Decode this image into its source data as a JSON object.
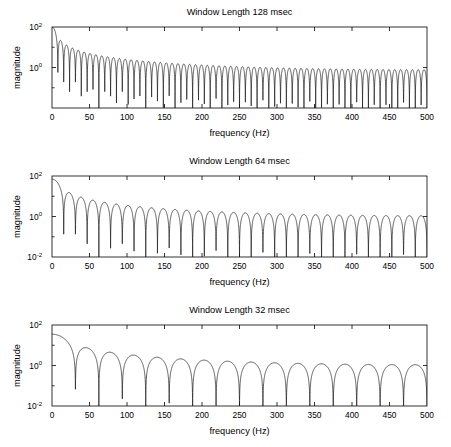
{
  "figure": {
    "background": "#ffffff",
    "line_color": "#1a1a1a",
    "axis_color": "#000000"
  },
  "panels": [
    {
      "title": "Window Length 128 msec",
      "xlabel": "frequency (Hz)",
      "ylabel": "magnitude",
      "xticks": [
        0,
        50,
        100,
        150,
        200,
        250,
        300,
        350,
        400,
        450,
        500
      ],
      "xticklabels": [
        "0",
        "50",
        "100",
        "150",
        "200",
        "250",
        "300",
        "350",
        "400",
        "450",
        "500"
      ],
      "yticks": [
        100,
        1
      ],
      "yticklabels": [
        "10",
        "10"
      ],
      "yexponents": [
        "2",
        "0"
      ],
      "ylim": [
        0.01,
        100
      ],
      "xlim": [
        0,
        500
      ]
    },
    {
      "title": "Window Length 64 msec",
      "xlabel": "frequency (Hz)",
      "ylabel": "magnitude",
      "xticks": [
        0,
        50,
        100,
        150,
        200,
        250,
        300,
        350,
        400,
        450,
        500
      ],
      "xticklabels": [
        "0",
        "50",
        "100",
        "150",
        "200",
        "250",
        "300",
        "350",
        "400",
        "450",
        "500"
      ],
      "yticks": [
        100,
        1,
        0.01
      ],
      "yticklabels": [
        "10",
        "10",
        "10"
      ],
      "yexponents": [
        "2",
        "0",
        "-2"
      ],
      "ylim": [
        0.01,
        100
      ],
      "xlim": [
        0,
        500
      ]
    },
    {
      "title": "Window Length 32 msec",
      "xlabel": "frequency (Hz)",
      "ylabel": "magnitude",
      "xticks": [
        0,
        50,
        100,
        150,
        200,
        250,
        300,
        350,
        400,
        450,
        500
      ],
      "xticklabels": [
        "0",
        "50",
        "100",
        "150",
        "200",
        "250",
        "300",
        "350",
        "400",
        "450",
        "500"
      ],
      "yticks": [
        100,
        1,
        0.01
      ],
      "yticklabels": [
        "10",
        "10",
        "10"
      ],
      "yexponents": [
        "2",
        "0",
        "-2"
      ],
      "ylim": [
        0.01,
        100
      ],
      "xlim": [
        0,
        500
      ]
    }
  ],
  "chart_data": [
    {
      "type": "line",
      "title": "Window Length 128 msec",
      "xlabel": "frequency (Hz)",
      "ylabel": "magnitude",
      "xlim": [
        0,
        500
      ],
      "ylim": [
        0.01,
        100
      ],
      "yscale": "log",
      "grid": false,
      "legend": null,
      "series": [
        {
          "name": "magnitude spectrum, 128 msec window",
          "description": "Sinc-like magnitude response of a 128 msec rectangular window; main lobe peaks near 100 at 0 Hz, rapid sidelobe ripple whose envelope decays to a minimum of about 1 near 250 Hz then grows again toward 500 Hz",
          "model": "window_sinc",
          "window_msec": 128,
          "peak_value": 100,
          "null_spacing_hz": 7.8,
          "envelope_minimum_hz": 250,
          "envelope_minimum_value": 0.9,
          "value_at_500hz": 1.0
        }
      ]
    },
    {
      "type": "line",
      "title": "Window Length 64 msec",
      "xlabel": "frequency (Hz)",
      "ylabel": "magnitude",
      "xlim": [
        0,
        500
      ],
      "ylim": [
        0.01,
        100
      ],
      "yscale": "log",
      "grid": false,
      "legend": null,
      "series": [
        {
          "name": "magnitude spectrum, 64 msec window",
          "description": "Sinc-like magnitude response of a 64 msec window; peak near 70 at low frequency, lobes spaced about 15.6 Hz, deep null reaching below 10^-2 at 250 Hz",
          "model": "window_sinc",
          "window_msec": 64,
          "peak_value": 70,
          "null_spacing_hz": 15.6,
          "deep_null_hz": 250,
          "deep_null_value": 0.006,
          "value_at_500hz": 1.0
        }
      ]
    },
    {
      "type": "line",
      "title": "Window Length 32 msec",
      "xlabel": "frequency (Hz)",
      "ylabel": "magnitude",
      "xlim": [
        0,
        500
      ],
      "ylim": [
        0.01,
        100
      ],
      "yscale": "log",
      "grid": false,
      "legend": null,
      "series": [
        {
          "name": "magnitude spectrum, 32 msec window",
          "description": "Sinc-like magnitude response of a 32 msec window; peak near 35 at low frequency, broad lobes spaced about 31 Hz, deep nulls near 125, 245, 365 and 490 Hz",
          "model": "window_sinc",
          "window_msec": 32,
          "peak_value": 35,
          "null_spacing_hz": 31.2,
          "deep_null_hz": [
            125,
            245,
            365,
            490
          ],
          "deep_null_value": 0.03,
          "value_at_500hz": 1.0
        }
      ]
    }
  ]
}
